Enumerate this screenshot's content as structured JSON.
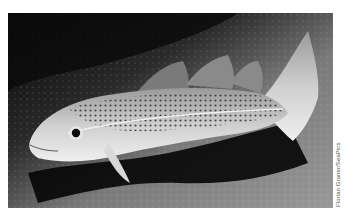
{
  "photo": {
    "subject": "Atlantic cod resting on sandy seabed",
    "colors": {
      "water": "#0e0e0e",
      "seabed": "#8a8a8a",
      "fish_body": "#c8c8c8",
      "fish_belly": "#e6e6e6",
      "spots": "#2a2a2a",
      "shadow": "#050505"
    }
  },
  "credit": {
    "text": "Florian Graner/SeaPics"
  }
}
